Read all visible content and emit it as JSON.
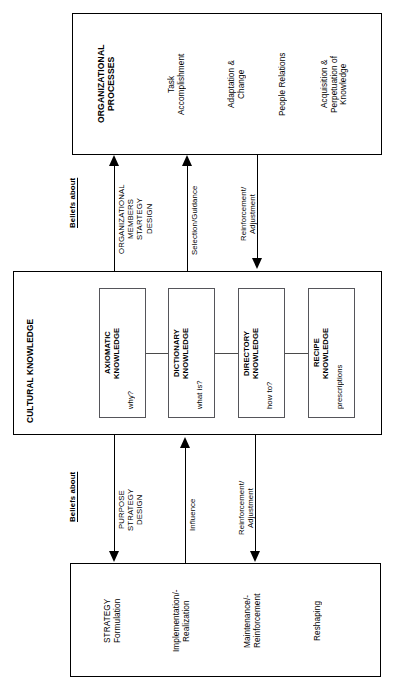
{
  "diagram": {
    "type": "block-flow-diagram",
    "orientation": "rotated-90-ccw",
    "colors": {
      "stroke": "#000000",
      "subbox_stroke": "#55555a",
      "background": "#ffffff",
      "text": "#000000"
    },
    "top_box": {
      "heading": "ORGANIZATIONAL\nPROCESSES",
      "items": [
        "Task\nAccomplishment",
        "Adaptation &\nChange",
        "People Relations",
        "Acquisition &\nPerpetuation of\nKnowledge"
      ]
    },
    "middle_box": {
      "title": "CULTURAL KNOWLEDGE",
      "cells": [
        {
          "name": "AXIOMATIC\nKNOWLEDGE",
          "question": "why?"
        },
        {
          "name": "DICTIONARY\nKNOWLEDGE",
          "question": "what is?"
        },
        {
          "name": "DIRECTORY\nKNOWLEDGE",
          "question": "how to?"
        },
        {
          "name": "RECIPE\nKNOWLEDGE",
          "question": "prescriptions"
        }
      ]
    },
    "bottom_box": {
      "items": [
        "STRATEGY\nFormulation",
        "Implementation/-\nRealization",
        "Maintenance/-\nReinforcement",
        "Reshaping"
      ]
    },
    "upper_connectors": {
      "beliefs_label": "Beliefs about",
      "edges": [
        {
          "label": "ORGANIZATIONAL\nMEMBERS\nSTARTEGY\nDESIGN",
          "direction": "up"
        },
        {
          "label": "Selection/Guidance",
          "direction": "up"
        },
        {
          "label": "Reinforcement/\nAdjustment",
          "direction": "down"
        }
      ]
    },
    "lower_connectors": {
      "beliefs_label": "Beliefs about",
      "edges": [
        {
          "label": "PURPOSE\nSTRATEGY\nDESIGN",
          "direction": "down"
        },
        {
          "label": "Influence",
          "direction": "up"
        },
        {
          "label": "Reinforcement/\nAdjustment",
          "direction": "down"
        }
      ]
    }
  }
}
